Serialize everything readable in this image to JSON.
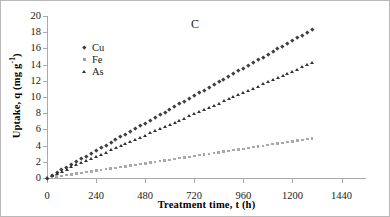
{
  "figure": {
    "panel_label": "C",
    "background": "#ffffff",
    "border_color": "#b9b9b9"
  },
  "chart_data": {
    "type": "scatter",
    "title": "",
    "subtitle": "",
    "panel": "C",
    "xlabel": "Treatment time, t (h)",
    "ylabel": "Uptake, q (mg g-1)",
    "ylabel_parts": {
      "main": "Uptake, q (mg g",
      "sup": "-1",
      "tail": ")"
    },
    "xlim": [
      0,
      1560
    ],
    "ylim": [
      0,
      20
    ],
    "xticks": [
      0,
      240,
      480,
      720,
      960,
      1200,
      1440
    ],
    "yticks": [
      0,
      2,
      4,
      6,
      8,
      10,
      12,
      14,
      16,
      18,
      20
    ],
    "grid": false,
    "legend_position": "upper-left-inside",
    "colors": {
      "Cu": "#3f3f3f",
      "Fe": "#a9a9a9",
      "As": "#333333"
    },
    "markers": {
      "Cu": "diamond",
      "Fe": "square",
      "As": "triangle"
    },
    "series": [
      {
        "name": "Cu",
        "marker": "diamond",
        "color": "#3f3f3f",
        "x": [
          0,
          24,
          48,
          72,
          96,
          120,
          144,
          168,
          192,
          216,
          240,
          264,
          288,
          312,
          336,
          360,
          384,
          408,
          432,
          456,
          480,
          504,
          528,
          552,
          576,
          600,
          624,
          648,
          672,
          696,
          720,
          744,
          768,
          792,
          816,
          840,
          864,
          888,
          912,
          936,
          960,
          984,
          1008,
          1032,
          1056,
          1080,
          1104,
          1128,
          1152,
          1176,
          1200,
          1224,
          1248,
          1272,
          1296
        ],
        "y": [
          0.0,
          0.34,
          0.68,
          1.02,
          1.36,
          1.7,
          2.04,
          2.38,
          2.72,
          3.06,
          3.4,
          3.74,
          4.08,
          4.42,
          4.76,
          5.1,
          5.44,
          5.78,
          6.12,
          6.46,
          6.8,
          7.14,
          7.48,
          7.82,
          8.16,
          8.5,
          8.84,
          9.18,
          9.52,
          9.86,
          10.2,
          10.54,
          10.88,
          11.22,
          11.56,
          11.9,
          12.24,
          12.58,
          12.92,
          13.26,
          13.6,
          13.94,
          14.28,
          14.62,
          14.96,
          15.3,
          15.64,
          15.98,
          16.32,
          16.66,
          17.0,
          17.34,
          17.68,
          18.02,
          18.36
        ]
      },
      {
        "name": "Fe",
        "marker": "square",
        "color": "#a9a9a9",
        "x": [
          0,
          24,
          48,
          72,
          96,
          120,
          144,
          168,
          192,
          216,
          240,
          264,
          288,
          312,
          336,
          360,
          384,
          408,
          432,
          456,
          480,
          504,
          528,
          552,
          576,
          600,
          624,
          648,
          672,
          696,
          720,
          744,
          768,
          792,
          816,
          840,
          864,
          888,
          912,
          936,
          960,
          984,
          1008,
          1032,
          1056,
          1080,
          1104,
          1128,
          1152,
          1176,
          1200,
          1224,
          1248,
          1272,
          1296
        ],
        "y": [
          0.0,
          0.09,
          0.18,
          0.27,
          0.36,
          0.45,
          0.54,
          0.63,
          0.72,
          0.81,
          0.91,
          1.0,
          1.09,
          1.18,
          1.27,
          1.36,
          1.45,
          1.54,
          1.63,
          1.72,
          1.81,
          1.9,
          1.99,
          2.08,
          2.17,
          2.26,
          2.36,
          2.45,
          2.54,
          2.63,
          2.72,
          2.81,
          2.9,
          2.99,
          3.08,
          3.17,
          3.26,
          3.35,
          3.44,
          3.53,
          3.62,
          3.71,
          3.81,
          3.9,
          3.99,
          4.08,
          4.17,
          4.26,
          4.35,
          4.44,
          4.53,
          4.62,
          4.71,
          4.8,
          4.9
        ]
      },
      {
        "name": "As",
        "marker": "triangle",
        "color": "#333333",
        "x": [
          0,
          24,
          48,
          72,
          96,
          120,
          144,
          168,
          192,
          216,
          240,
          264,
          288,
          312,
          336,
          360,
          384,
          408,
          432,
          456,
          480,
          504,
          528,
          552,
          576,
          600,
          624,
          648,
          672,
          696,
          720,
          744,
          768,
          792,
          816,
          840,
          864,
          888,
          912,
          936,
          960,
          984,
          1008,
          1032,
          1056,
          1080,
          1104,
          1128,
          1152,
          1176,
          1200,
          1224,
          1248,
          1272,
          1296
        ],
        "y": [
          0.0,
          0.26,
          0.53,
          0.79,
          1.05,
          1.32,
          1.58,
          1.84,
          2.1,
          2.37,
          2.63,
          2.89,
          3.16,
          3.42,
          3.68,
          3.94,
          4.21,
          4.47,
          4.73,
          5.0,
          5.26,
          5.52,
          5.79,
          6.05,
          6.31,
          6.57,
          6.84,
          7.1,
          7.36,
          7.63,
          7.89,
          8.15,
          8.41,
          8.68,
          8.94,
          9.2,
          9.47,
          9.73,
          9.99,
          10.26,
          10.52,
          10.78,
          11.04,
          11.31,
          11.57,
          11.83,
          12.1,
          12.36,
          12.62,
          12.88,
          13.15,
          13.41,
          13.67,
          13.94,
          14.2
        ]
      }
    ]
  },
  "legend": {
    "items": [
      {
        "label": "Cu",
        "marker": "diamond",
        "color": "#3f3f3f"
      },
      {
        "label": "Fe",
        "marker": "square",
        "color": "#a9a9a9"
      },
      {
        "label": "As",
        "marker": "triangle",
        "color": "#333333"
      }
    ]
  }
}
